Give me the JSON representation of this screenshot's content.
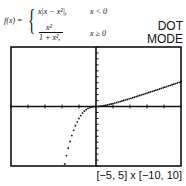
{
  "formula": {
    "lhs": "f(x) =",
    "case1_expr": "x|x − x²|,",
    "case1_cond": "x < 0",
    "case2_num": "x²",
    "case2_den": "1 + x²,",
    "case2_cond": "x ≥ 0"
  },
  "mode": {
    "line1": "DOT",
    "line2": "MODE"
  },
  "window_label": "[−5, 5] x [−10, 10]",
  "chart_data": {
    "type": "scatter",
    "title": "",
    "xlabel": "",
    "ylabel": "",
    "xlim": [
      -5,
      5
    ],
    "ylim": [
      -10,
      10
    ],
    "xticks_step": 1,
    "yticks_step": 1,
    "grid": false,
    "mode": "dot",
    "function": "f(x) = x|x - x^2| for x<0; x^2/(1+x) for x>=0",
    "series": [
      {
        "name": "f(x)",
        "x_range": [
          -5,
          5
        ],
        "samples": 95
      }
    ]
  }
}
